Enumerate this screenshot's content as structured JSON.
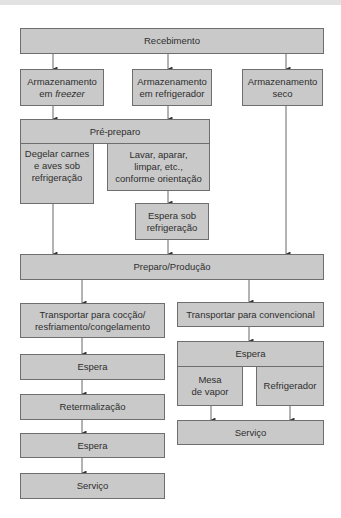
{
  "diagram": {
    "nodes": {
      "recebimento": "Recebimento",
      "armaz_freezer_1": "Armazenamento",
      "armaz_freezer_2": "em ",
      "armaz_freezer_italic": "freezer",
      "armaz_refrigerador": "Armazenamento\nem refrigerador",
      "armaz_seco": "Armazenamento\nseco",
      "pre_preparo": "Pré-preparo",
      "degelar": "Degelar carnes\ne aves sob\nrefrigeração",
      "lavar": "Lavar, aparar,\nlimpar, etc.,\nconforme orientação",
      "espera_sob_refrig": "Espera sob\nrefrigeração",
      "preparo_producao": "Preparo/Produção",
      "transp_coccao": "Transportar para cocção/\nresfriamento/congelamento",
      "espera_left_1": "Espera",
      "retermalizacao": "Retermalização",
      "espera_left_2": "Espera",
      "servico_left": "Serviço",
      "transp_convencional": "Transportar para convencional",
      "espera_right": "Espera",
      "mesa_vapor": "Mesa\nde vapor",
      "refrigerador": "Refrigerador",
      "servico_right": "Serviço"
    },
    "edges": [
      [
        "recebimento",
        "armaz_freezer"
      ],
      [
        "recebimento",
        "armaz_refrigerador"
      ],
      [
        "recebimento",
        "armaz_seco"
      ],
      [
        "armaz_freezer",
        "pre_preparo"
      ],
      [
        "armaz_refrigerador",
        "pre_preparo"
      ],
      [
        "lavar",
        "espera_sob_refrig"
      ],
      [
        "degelar",
        "preparo_producao"
      ],
      [
        "espera_sob_refrig",
        "preparo_producao"
      ],
      [
        "armaz_seco",
        "preparo_producao"
      ],
      [
        "preparo_producao",
        "transp_coccao"
      ],
      [
        "preparo_producao",
        "transp_convencional"
      ],
      [
        "transp_coccao",
        "espera_left_1"
      ],
      [
        "espera_left_1",
        "retermalizacao"
      ],
      [
        "retermalizacao",
        "espera_left_2"
      ],
      [
        "espera_left_2",
        "servico_left"
      ],
      [
        "transp_convencional",
        "espera_right"
      ],
      [
        "mesa_vapor",
        "servico_right"
      ],
      [
        "refrigerador",
        "servico_right"
      ]
    ],
    "colors": {
      "box_fill": "#c9c9c9",
      "box_border": "#6e6e6e",
      "line": "#555555",
      "text": "#2e2e2e"
    }
  }
}
